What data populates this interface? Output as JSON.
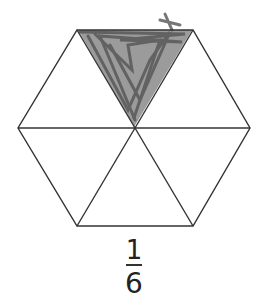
{
  "diagram": {
    "shape": "regular hexagon divided into 6 equilateral triangles",
    "stroke_color": "#333333",
    "shade_color": "#6b6b6b",
    "total_parts": 6,
    "shaded_parts": 1,
    "shaded_part": "top triangle"
  },
  "fraction": {
    "numerator": "1",
    "denominator": "6"
  }
}
